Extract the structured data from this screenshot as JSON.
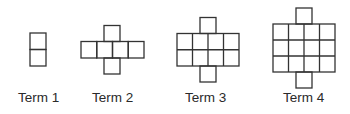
{
  "stroke_color": "#333333",
  "cell_size": 16,
  "terms": [
    {
      "label": "Term 1",
      "squares": 2,
      "grid": {
        "cols": 1,
        "rows": 2
      },
      "extra": "none"
    },
    {
      "label": "Term 2",
      "squares": 6,
      "grid": {
        "cols": 4,
        "rows": 1
      },
      "extra": "one square above and one below column 2"
    },
    {
      "label": "Term 3",
      "squares": 10,
      "grid": {
        "cols": 4,
        "rows": 2
      },
      "extra": "one square above and one below column 2"
    },
    {
      "label": "Term 4",
      "squares": 14,
      "grid": {
        "cols": 4,
        "rows": 3
      },
      "extra": "one square above and one below column 2"
    }
  ]
}
